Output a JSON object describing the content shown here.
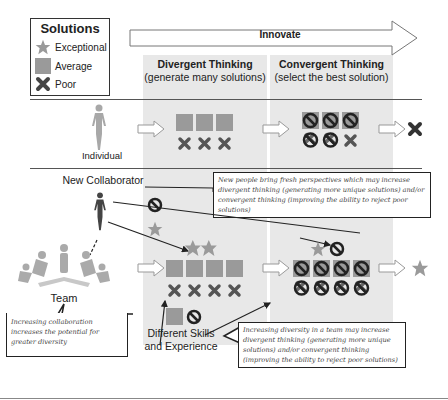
{
  "legend": {
    "title": "Solutions",
    "items": [
      {
        "icon": "star-icon",
        "label": "Exceptional"
      },
      {
        "icon": "square-icon",
        "label": "Average"
      },
      {
        "icon": "x-icon",
        "label": "Poor"
      }
    ]
  },
  "header": {
    "arrow_label": "Innovate",
    "divergent": {
      "title": "Divergent Thinking",
      "subtitle": "(generate many solutions)"
    },
    "convergent": {
      "title": "Convergent Thinking",
      "subtitle": "(select the best solution)"
    }
  },
  "rows": {
    "individual": {
      "label": "Individual",
      "divergent": {
        "average": 3,
        "poor": 3
      },
      "convergent": {
        "rejected": 5,
        "kept_poor": 1
      },
      "outcome": "x-icon"
    },
    "team": {
      "label": "Team",
      "divergent": {
        "exceptional": 2,
        "average": 4,
        "poor": 4
      },
      "convergent": {
        "rejected": 8,
        "kept_exceptional": 1
      },
      "outcome": "star-icon"
    }
  },
  "labels": {
    "new_collaborator": "New Collaborator",
    "skills_line1": "Different Skills",
    "skills_line2": "and Experience"
  },
  "notes": {
    "new_people": "New people bring fresh perspectives which may increase divergent thinking (generating more unique solutions) and/or convergent thinking (improving the ability to reject poor solutions)",
    "collaboration": "Increasing collaboration increases the potential for greater diversity",
    "diversity": "Increasing diversity in a team may increase divergent thinking (generating more unique solutions) and/or convergent thinking (improving the ability to reject poor solutions)"
  },
  "colors": {
    "shape": "#9a9a9a",
    "dark": "#333333",
    "column_bg": "#e8e8e8"
  }
}
